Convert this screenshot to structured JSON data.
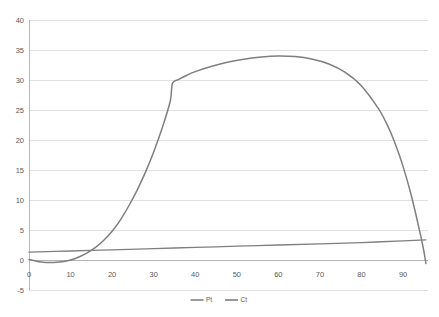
{
  "chart_data": {
    "type": "line",
    "title": "",
    "subtitle": "",
    "xlabel": "",
    "ylabel": "",
    "xlim": [
      0,
      96
    ],
    "ylim": [
      -5,
      40
    ],
    "grid": true,
    "legend_position": "bottom",
    "x_ticks": [
      0,
      10,
      20,
      30,
      40,
      50,
      60,
      70,
      80,
      90
    ],
    "x_tick_labels": [
      "0",
      "10",
      "20",
      "30",
      "40",
      "50",
      "60",
      "70",
      "80",
      "90"
    ],
    "y_ticks": [
      -5,
      0,
      5,
      10,
      15,
      20,
      25,
      30,
      35,
      40
    ],
    "y_tick_labels": [
      "-5",
      "0",
      "5",
      "10",
      "15",
      "20",
      "25",
      "30",
      "35",
      "40"
    ],
    "series": [
      {
        "name": "Pt",
        "color": "#7f7f7f",
        "x": [
          0,
          2,
          4,
          6,
          8,
          10,
          12,
          14,
          16,
          18,
          20,
          22,
          24,
          26,
          28,
          30,
          32,
          34,
          34.5,
          36,
          38,
          40,
          44,
          48,
          52,
          56,
          60,
          64,
          68,
          72,
          76,
          80,
          84,
          86,
          88,
          90,
          92,
          94,
          95,
          95.5
        ],
        "y": [
          0.1,
          -0.25,
          -0.4,
          -0.4,
          -0.3,
          0.0,
          0.5,
          1.2,
          2.1,
          3.3,
          4.8,
          6.7,
          9.0,
          11.6,
          14.6,
          18.0,
          21.9,
          26.5,
          29.4,
          30.1,
          30.8,
          31.4,
          32.3,
          33.0,
          33.5,
          33.85,
          34.0,
          33.9,
          33.5,
          32.7,
          31.3,
          29.0,
          25.3,
          22.8,
          19.6,
          15.6,
          10.7,
          4.8,
          1.5,
          -0.6
        ]
      },
      {
        "name": "Ct",
        "color": "#7f7f7f",
        "x": [
          0,
          10,
          20,
          30,
          40,
          50,
          60,
          70,
          80,
          90,
          95.5
        ],
        "y": [
          1.3,
          1.5,
          1.7,
          1.9,
          2.1,
          2.3,
          2.5,
          2.7,
          2.9,
          3.2,
          3.35
        ]
      }
    ],
    "legend_entries": [
      {
        "label": "Pt",
        "color": "#7f7f7f"
      },
      {
        "label": "Ct",
        "color": "#7f7f7f"
      }
    ],
    "annotations": []
  },
  "plot_area": {
    "left": 29,
    "right": 428,
    "top": 20,
    "bottom": 290
  }
}
